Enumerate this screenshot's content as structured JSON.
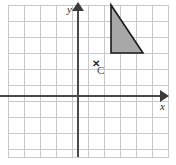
{
  "figure": {
    "background_color": "#ffffff",
    "grid_color": "#c9c9c9",
    "axis_color": "#4a4a4a"
  },
  "axes": {
    "x_label": "x",
    "y_label": "y",
    "x_arrow_icon": "arrow-right-icon",
    "y_arrow_icon": "arrow-up-icon",
    "origin_px": [
      78,
      96
    ],
    "cell_size_px": 16,
    "x_range_units": [
      -4.4,
      5.6
    ],
    "y_range_units": [
      -3.8,
      5.7
    ],
    "tick_labels": [],
    "gridlines": true
  },
  "shapes": [
    {
      "name": "shaded-right-triangle",
      "type": "polygon",
      "vertices_units": [
        [
          2,
          5.7
        ],
        [
          2,
          2.7
        ],
        [
          4,
          2.7
        ]
      ],
      "vertices_px": [
        [
          111,
          5
        ],
        [
          111,
          53
        ],
        [
          143,
          53
        ]
      ],
      "fill_color": "#a8a8a8",
      "stroke_color": "#1a1a1a",
      "stroke_width": 1.6
    }
  ],
  "points": [
    {
      "name": "point-c",
      "label": "C",
      "marker": "✕",
      "marker_icon": "cross-mark-icon",
      "position_units": [
        1,
        2
      ],
      "position_px": [
        95,
        64
      ],
      "label_color": "#4a4a4a"
    }
  ],
  "chart_data": {
    "type": "scatter",
    "title": "",
    "xlabel": "x",
    "ylabel": "y",
    "xlim": [
      -4.4,
      5.6
    ],
    "ylim": [
      -3.8,
      5.7
    ],
    "grid": true,
    "legend": "none",
    "points": [
      {
        "label": "C",
        "x": 1,
        "y": 2
      }
    ],
    "polygons": [
      {
        "label": "triangle",
        "x": [
          2,
          2,
          4
        ],
        "y": [
          5.7,
          2.7,
          2.7
        ],
        "fill": "#a8a8a8"
      }
    ]
  }
}
